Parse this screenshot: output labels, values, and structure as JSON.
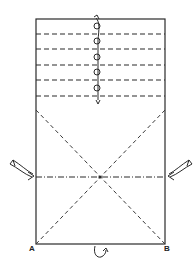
{
  "diagram": {
    "type": "folding-diagram",
    "stroke_color": "#2a2a2a",
    "background": "#ffffff",
    "outline": {
      "x": 36,
      "y": 19,
      "width": 129,
      "height": 225
    },
    "valley_folds_top": [
      34,
      49,
      65,
      80,
      96
    ],
    "pleat_marks": {
      "x": 96,
      "ys": [
        26,
        41,
        57,
        72,
        88
      ]
    },
    "pleat_arrow": {
      "x": 98,
      "y_top": 18,
      "y_bottom": 104
    },
    "diagonals": [
      {
        "from": [
          36,
          110
        ],
        "to": [
          165,
          244
        ]
      },
      {
        "from": [
          165,
          110
        ],
        "to": [
          36,
          244
        ]
      }
    ],
    "mountain_fold_center_y": 177,
    "crossing_point": [
      100,
      177
    ],
    "side_arrows": [
      "left-push-arrow",
      "right-push-arrow"
    ],
    "bottom_turn_arrow": "turn-over-arrow",
    "labels": {
      "corner_a": "A",
      "corner_b": "B"
    }
  }
}
